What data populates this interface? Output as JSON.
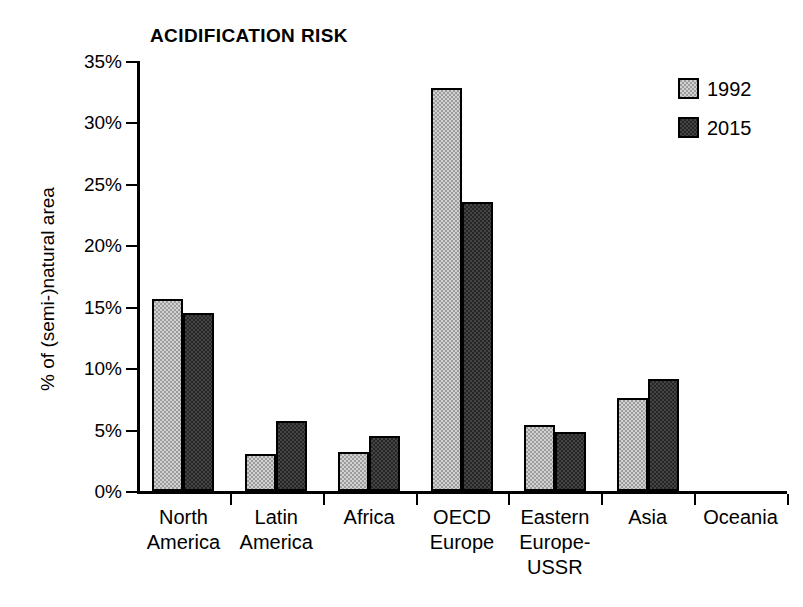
{
  "chart_data": {
    "type": "bar",
    "title": "ACIDIFICATION RISK",
    "xlabel": "",
    "ylabel": "% of (semi-)natural area",
    "ylim": [
      0,
      35
    ],
    "yticks": [
      0,
      5,
      10,
      15,
      20,
      25,
      30,
      35
    ],
    "ytick_labels": [
      "0%",
      "5%",
      "10%",
      "15%",
      "20%",
      "25%",
      "30%",
      "35%"
    ],
    "grid": false,
    "legend_position": "top-right",
    "categories": [
      "North America",
      "Latin America",
      "Africa",
      "OECD Europe",
      "Eastern Europe-USSR",
      "Asia",
      "Oceania"
    ],
    "category_labels": [
      "North\nAmerica",
      "Latin\nAmerica",
      "Africa",
      "OECD\nEurope",
      "Eastern\nEurope-\nUSSR",
      "Asia",
      "Oceania"
    ],
    "series": [
      {
        "name": "1992",
        "color": "#9c9c9c",
        "values": [
          15.6,
          3.0,
          3.2,
          32.8,
          5.4,
          7.6,
          0.0
        ]
      },
      {
        "name": "2015",
        "color": "#262626",
        "values": [
          14.5,
          5.7,
          4.5,
          23.5,
          4.8,
          9.1,
          0.0
        ]
      }
    ]
  },
  "legend": {
    "items": [
      {
        "label": "1992"
      },
      {
        "label": "2015"
      }
    ]
  }
}
